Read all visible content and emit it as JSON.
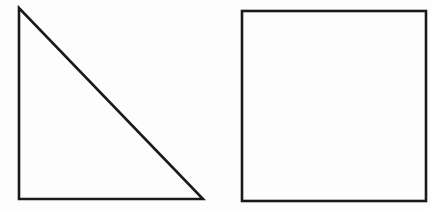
{
  "figure": {
    "background": "#ffffff",
    "stroke_color": "#1a1a1a",
    "stroke_width": 2.6,
    "shapes": [
      {
        "type": "right-triangle",
        "name": "triangle",
        "points": [
          [
            19,
            8
          ],
          [
            19,
            199
          ],
          [
            203,
            199
          ]
        ]
      },
      {
        "type": "square",
        "name": "square",
        "x": 242,
        "y": 11,
        "width": 184,
        "height": 190
      }
    ]
  }
}
